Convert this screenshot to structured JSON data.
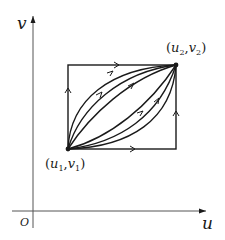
{
  "diagram": {
    "axes": {
      "x_label": "u",
      "y_label": "v",
      "origin_label": "O"
    },
    "points": {
      "start": {
        "label_u": "u",
        "label_v": "v",
        "sub": "1",
        "display": "(u1,v1)"
      },
      "end": {
        "label_u": "u",
        "label_v": "v",
        "sub": "2",
        "display": "(u2,v2)"
      }
    },
    "colors": {
      "line": "#1a1a1a",
      "axis": "#555555",
      "background": "#ffffff"
    }
  }
}
